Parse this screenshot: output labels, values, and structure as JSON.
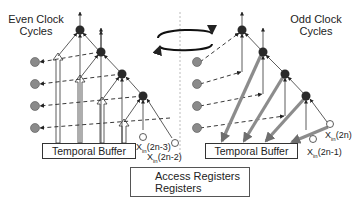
{
  "panels": {
    "even": {
      "title_line1": "Even Clock",
      "title_line2": "Cycles",
      "buffer_label": "Temporal Buffer",
      "inputs": [
        {
          "base": "X",
          "sub": "in",
          "arg": "(2n-3)"
        },
        {
          "base": "X",
          "sub": "in",
          "arg": "(2n-2)"
        }
      ]
    },
    "odd": {
      "title_line1": "Odd Clock",
      "title_line2": "Cycles",
      "buffer_label": "Temporal Buffer",
      "inputs": [
        {
          "base": "X",
          "sub": "in",
          "arg": "(2n)"
        },
        {
          "base": "X",
          "sub": "in",
          "arg": "(2n-1)"
        }
      ]
    }
  },
  "legend": {
    "access_registers": "Access Registers",
    "registers": "Registers"
  },
  "icons": {
    "swap": "rotation-arrows-icon",
    "register": "gray-circle",
    "node": "dark-circle",
    "input": "hollow-circle"
  },
  "colors": {
    "register": "#8a8a8a",
    "node": "#2a2a2a",
    "thick_arrow": "#8c8c8c",
    "line": "#333333",
    "divider": "#bbbbbb"
  }
}
